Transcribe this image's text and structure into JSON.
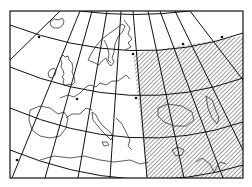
{
  "map": {
    "projection": "conic",
    "region_shown": "Europe",
    "frame": {
      "x": 10,
      "y": 11,
      "width": 233,
      "height": 167
    },
    "colors": {
      "line": "#111111",
      "background": "#ffffff",
      "hatch": "#222222"
    },
    "highlighted_area": {
      "style": "diagonal-hatch",
      "description": "Eastern Europe / Black Sea sector"
    },
    "graticule": {
      "parallels": 5,
      "meridians": 9
    }
  }
}
